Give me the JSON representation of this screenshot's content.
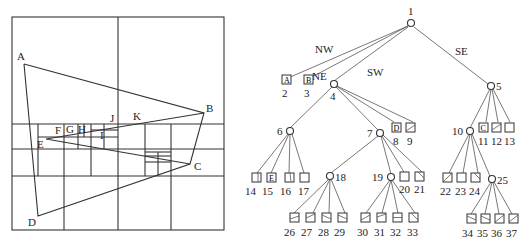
{
  "region_diagram": {
    "points": {
      "A": "A",
      "B": "B",
      "C": "C",
      "D": "D",
      "E": "E",
      "F": "F",
      "G": "G",
      "H": "H",
      "I": "I",
      "J": "J",
      "K": "K"
    }
  },
  "tree": {
    "edge_labels": {
      "nw": "NW",
      "ne": "NE",
      "sw": "SW",
      "se": "SE"
    },
    "nodes": {
      "n1": "1",
      "n4": "4",
      "n5": "5",
      "n6": "6",
      "n7": "7",
      "n10": "10",
      "n18": "18",
      "n19": "19",
      "n25": "25"
    },
    "leaves": {
      "l2": "2",
      "l3": "3",
      "l8": "8",
      "l9": "9",
      "l11": "11",
      "l12": "12",
      "l13": "13",
      "l14": "14",
      "l15": "15",
      "l16": "16",
      "l17": "17",
      "l20": "20",
      "l21": "21",
      "l22": "22",
      "l23": "23",
      "l24": "24",
      "l26": "26",
      "l27": "27",
      "l28": "28",
      "l29": "29",
      "l30": "30",
      "l31": "31",
      "l32": "32",
      "l33": "33",
      "l34": "34",
      "l35": "35",
      "l36": "36",
      "l37": "37"
    },
    "leaf_glyphs": {
      "l2": "A",
      "l3": "B",
      "l8": "D",
      "l11": "C",
      "l15": "E"
    }
  }
}
